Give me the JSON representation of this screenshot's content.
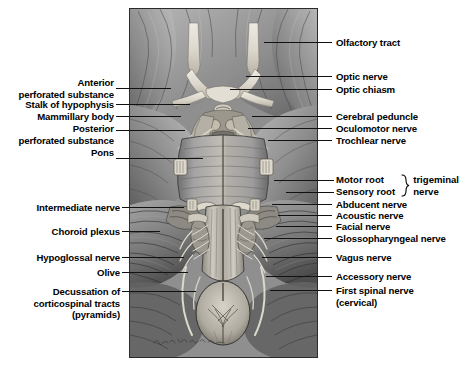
{
  "figure": {
    "signature": "Helen Wilkinson",
    "plate_background": "#8c8c8c",
    "text_color": "#000000",
    "leader_color": "#111111"
  },
  "labels_left": [
    {
      "id": "anterior-perforated-substance",
      "text": "Anterior\nperforated substance"
    },
    {
      "id": "stalk-of-hypophysis",
      "text": "Stalk of hypophysis"
    },
    {
      "id": "mammillary-body",
      "text": "Mammillary body"
    },
    {
      "id": "posterior-perforated-substance",
      "text": "Posterior\nperforated substance"
    },
    {
      "id": "pons",
      "text": "Pons"
    },
    {
      "id": "intermediate-nerve",
      "text": "Intermediate nerve"
    },
    {
      "id": "choroid-plexus",
      "text": "Choroid plexus"
    },
    {
      "id": "hypoglossal-nerve",
      "text": "Hypoglossal nerve"
    },
    {
      "id": "olive",
      "text": "Olive"
    },
    {
      "id": "decussation-of-corticospinal-tracts",
      "text": "Decussation of\ncorticospinal tracts\n(pyramids)"
    }
  ],
  "labels_right": [
    {
      "id": "olfactory-tract",
      "text": "Olfactory tract"
    },
    {
      "id": "optic-nerve",
      "text": "Optic nerve"
    },
    {
      "id": "optic-chiasm",
      "text": "Optic chiasm"
    },
    {
      "id": "cerebral-peduncle",
      "text": "Cerebral peduncle"
    },
    {
      "id": "oculomotor-nerve",
      "text": "Oculomotor nerve"
    },
    {
      "id": "trochlear-nerve",
      "text": "Trochlear nerve"
    },
    {
      "id": "abducent-nerve",
      "text": "Abducent nerve"
    },
    {
      "id": "acoustic-nerve",
      "text": "Acoustic nerve"
    },
    {
      "id": "facial-nerve",
      "text": "Facial nerve"
    },
    {
      "id": "glossopharyngeal-nerve",
      "text": "Glossopharyngeal nerve"
    },
    {
      "id": "vagus-nerve",
      "text": "Vagus nerve"
    },
    {
      "id": "accessory-nerve",
      "text": "Accessory nerve"
    },
    {
      "id": "first-spinal-nerve",
      "text": "First spinal nerve\n(cervical)"
    }
  ],
  "trigeminal": {
    "motor_root": "Motor root",
    "sensory_root": "Sensory root",
    "roots_block": "Motor root\nSensory root",
    "name_block": "trigeminal\nnerve",
    "trigeminal_word": "trigeminal",
    "nerve_word": "nerve",
    "brace": "}"
  }
}
